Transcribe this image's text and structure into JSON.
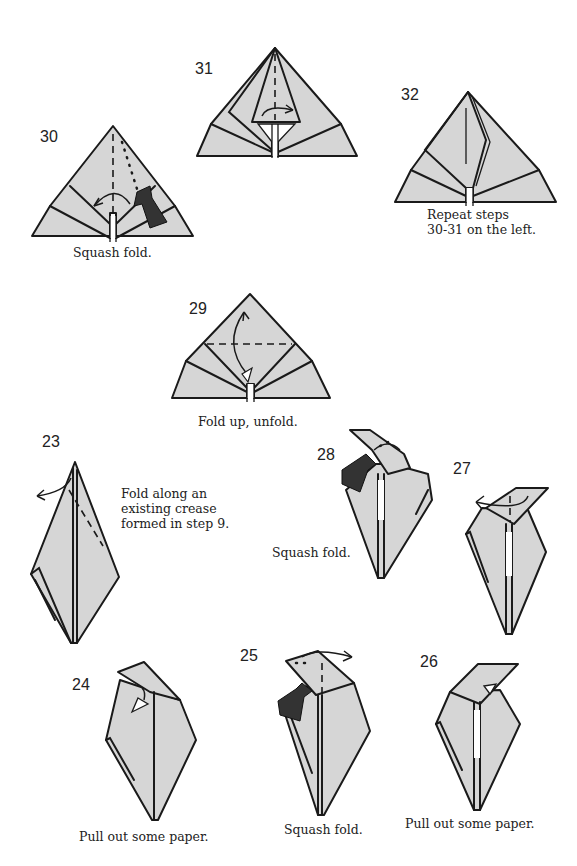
{
  "page": {
    "paper_color": "#d6d6d6",
    "line_color": "#1a1a1a"
  },
  "steps": [
    {
      "number": "30",
      "caption": "Squash fold.",
      "icons": [
        "valley-fold-line",
        "mountain-fold-line",
        "fold-arrow",
        "squash-arrow"
      ]
    },
    {
      "number": "31",
      "caption": "",
      "icons": [
        "valley-fold-line",
        "fold-arrow"
      ]
    },
    {
      "number": "32",
      "caption": "Repeat steps\n30-31 on the left.",
      "caption_lines": [
        "Repeat steps",
        "30-31 on the left."
      ]
    },
    {
      "number": "29",
      "caption": "Fold up, unfold.",
      "icons": [
        "valley-fold-line",
        "fold-unfold-arrow"
      ]
    },
    {
      "number": "23",
      "caption_lines": [
        "Fold along an",
        "existing crease",
        "formed in step 9."
      ],
      "icons": [
        "valley-fold-line",
        "fold-arrow"
      ]
    },
    {
      "number": "28",
      "caption": "Squash fold.",
      "icons": [
        "squash-arrow",
        "fold-arrow"
      ]
    },
    {
      "number": "27",
      "caption": "",
      "icons": [
        "fold-arrow"
      ]
    },
    {
      "number": "24",
      "caption": "Pull out some paper.",
      "icons": [
        "pull-arrow"
      ]
    },
    {
      "number": "25",
      "caption": "Squash fold.",
      "icons": [
        "mountain-fold-line",
        "fold-arrow",
        "squash-arrow"
      ]
    },
    {
      "number": "26",
      "caption": "Pull out some paper.",
      "icons": [
        "pull-arrow"
      ]
    }
  ]
}
